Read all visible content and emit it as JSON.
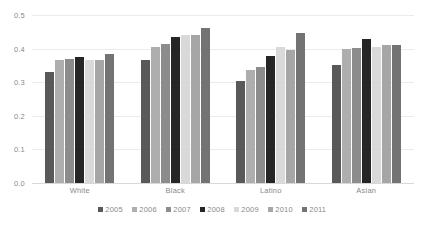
{
  "chart_data": {
    "type": "bar",
    "title": "",
    "xlabel": "",
    "ylabel": "",
    "ylim": [
      0.0,
      0.5
    ],
    "ytick_labels": [
      "0.0",
      "0.1",
      "0.2",
      "0.3",
      "0.4",
      "0.5"
    ],
    "ytick_values": [
      0.0,
      0.1,
      0.2,
      0.3,
      0.4,
      0.5
    ],
    "grid": true,
    "legend_position": "bottom",
    "categories": [
      "White",
      "Black",
      "Latino",
      "Asian"
    ],
    "series": [
      {
        "name": "2005",
        "color": "#595959",
        "values": [
          0.33,
          0.365,
          0.305,
          0.35
        ]
      },
      {
        "name": "2006",
        "color": "#aeaeae",
        "values": [
          0.365,
          0.405,
          0.335,
          0.398
        ]
      },
      {
        "name": "2007",
        "color": "#8c8c8c",
        "values": [
          0.368,
          0.415,
          0.345,
          0.403
        ]
      },
      {
        "name": "2008",
        "color": "#262626",
        "values": [
          0.375,
          0.435,
          0.378,
          0.43
        ]
      },
      {
        "name": "2009",
        "color": "#d9d9d9",
        "values": [
          0.365,
          0.44,
          0.405,
          0.405
        ]
      },
      {
        "name": "2010",
        "color": "#a6a6a6",
        "values": [
          0.365,
          0.44,
          0.395,
          0.412
        ]
      },
      {
        "name": "2011",
        "color": "#737373",
        "values": [
          0.385,
          0.46,
          0.445,
          0.412
        ]
      }
    ]
  }
}
